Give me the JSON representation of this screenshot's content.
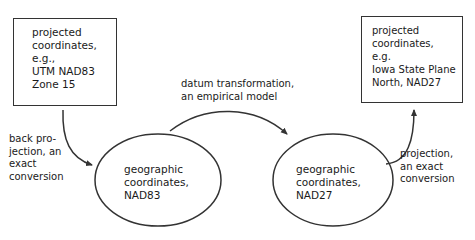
{
  "nodes": {
    "left_box": {
      "text": "projected\ncoordinates,\ne.g.,\nUTM NAD83\nZone 15"
    },
    "right_box": {
      "text": "projected\ncoordinates,\ne.g.\nIowa State Plane\nNorth, NAD27"
    },
    "left_ellipse": {
      "text": "geographic\ncoordinates,\nNAD83"
    },
    "right_ellipse": {
      "text": "geographic\ncoordinates,\nNAD27"
    }
  },
  "edges": {
    "back_projection": {
      "label": "back pro-\njection, an\nexact\nconversion"
    },
    "datum_transformation": {
      "label": "datum transformation,\nan empirical model"
    },
    "projection": {
      "label": "projection,\nan exact\nconversion"
    }
  },
  "colors": {
    "stroke": "#333333",
    "text": "#1a1a1a",
    "background": "#ffffff"
  }
}
